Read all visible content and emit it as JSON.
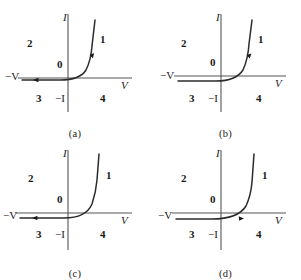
{
  "figure": {
    "background_color": "#ffffff",
    "ink_color": "#2b2b2b",
    "axis_color": "#555555",
    "panels": [
      {
        "id": "a",
        "caption": "(a)",
        "axis_labels": {
          "vertical_positive": "I",
          "vertical_negative": "−I",
          "horizontal_positive": "V",
          "horizontal_negative": "−V",
          "origin": "0"
        },
        "quadrant_labels": {
          "q1": "1",
          "q2": "2",
          "q3": "3",
          "q4": "4"
        },
        "markers": [
          {
            "name": "arrow-on-forward-branch",
            "direction": "up-right"
          },
          {
            "name": "arrow-on-reverse-branch",
            "direction": "left"
          }
        ],
        "curve_note": "reverse branch flat on axis, forward knee near origin, steep rise in quadrant 1"
      },
      {
        "id": "b",
        "caption": "(b)",
        "axis_labels": {
          "vertical_positive": "I",
          "vertical_negative": "−I",
          "horizontal_positive": "V",
          "horizontal_negative": "−V",
          "origin": "0"
        },
        "quadrant_labels": {
          "q1": "1",
          "q2": "2",
          "q3": "3",
          "q4": "4"
        },
        "markers": [
          {
            "name": "arrow-on-forward-branch",
            "direction": "up"
          }
        ],
        "curve_note": "reverse branch slightly below axis in quadrant 3, forward knee right of origin"
      },
      {
        "id": "c",
        "caption": "(c)",
        "axis_labels": {
          "vertical_positive": "I",
          "vertical_negative": "−I",
          "horizontal_positive": "V",
          "horizontal_negative": "−V",
          "origin": "0"
        },
        "quadrant_labels": {
          "q1": "1",
          "q2": "2",
          "q3": "3",
          "q4": "4"
        },
        "markers": [
          {
            "name": "arrow-on-reverse-branch",
            "direction": "left"
          }
        ],
        "curve_note": "reverse branch flat along negative V axis, forward knee well right of origin, very steep rise"
      },
      {
        "id": "d",
        "caption": "(d)",
        "axis_labels": {
          "vertical_positive": "I",
          "vertical_negative": "−I",
          "horizontal_positive": "V",
          "horizontal_negative": "−V",
          "origin": "0"
        },
        "quadrant_labels": {
          "q1": "1",
          "q2": "2",
          "q3": "3",
          "q4": "4"
        },
        "markers": [
          {
            "name": "arrow-on-forward-branch",
            "direction": "right"
          }
        ],
        "curve_note": "reverse branch slightly below axis sloping up to knee right of origin, steep rise in quadrant 1"
      }
    ]
  }
}
